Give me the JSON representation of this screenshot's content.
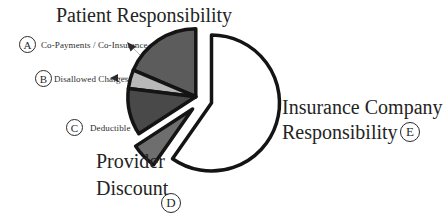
{
  "labels": {
    "patient_group": "Patient Responsibility",
    "callouts": [
      {
        "letter": "A",
        "text": "Co-Payments / Co-Insurance"
      },
      {
        "letter": "B",
        "text": "Disallowed Charges"
      },
      {
        "letter": "C",
        "text": "Deductible"
      }
    ],
    "provider": {
      "letter": "D",
      "line1": "Provider",
      "line2": "Discount"
    },
    "insurance": {
      "letter": "E",
      "line1": "Insurance Company",
      "line2": "Responsibility"
    }
  },
  "colors": {
    "background": "#ffffff",
    "outline": "#141414",
    "text": "#242424"
  },
  "chart_data": {
    "type": "pie",
    "title": "",
    "legend_position": "callout-labels",
    "exploded": true,
    "rotation": "starts at 12 o'clock, clockwise",
    "slices": [
      {
        "id": "E",
        "label": "Insurance Company Responsibility",
        "group": "insurance",
        "value_pct": 60,
        "start_deg": 235,
        "end_deg": 450,
        "color": "#ffffff"
      },
      {
        "id": "D",
        "label": "Provider Discount",
        "group": "provider",
        "value_pct": 6,
        "start_deg": 213,
        "end_deg": 235,
        "color": "#6e6e6e"
      },
      {
        "id": "C",
        "label": "Deductible",
        "group": "patient",
        "value_pct": 11,
        "start_deg": 173,
        "end_deg": 213,
        "color": "#494949"
      },
      {
        "id": "B",
        "label": "Disallowed Charges",
        "group": "patient",
        "value_pct": 4,
        "start_deg": 157,
        "end_deg": 173,
        "color": "#b8b8b8"
      },
      {
        "id": "A",
        "label": "Co-Payments / Co-Insurance",
        "group": "patient",
        "value_pct": 19,
        "start_deg": 90,
        "end_deg": 157,
        "color": "#5c5c5c"
      }
    ]
  }
}
